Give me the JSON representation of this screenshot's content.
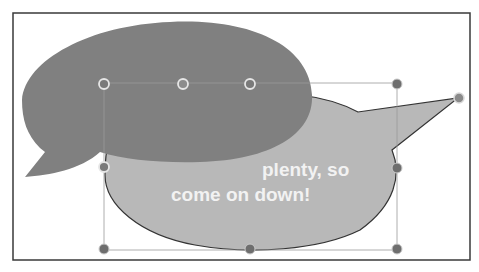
{
  "slide": {
    "background": "#ffffff",
    "border_color": "#333333"
  },
  "shapes": {
    "front_bubble": {
      "fill": "#808080",
      "kind": "oval-callout",
      "tail_direction": "lower-left"
    },
    "back_bubble": {
      "fill": "#b8b8b8",
      "outline": "#333333",
      "kind": "oval-callout",
      "tail_direction": "right",
      "text_line_1": "… plenty, so",
      "text_line_1_visible": "plenty, so",
      "text_line_2": "come on down!"
    }
  },
  "selection": {
    "handle_color": "#8a8a8a",
    "handle_outline": "#e0e0e0",
    "front_handles": [
      "top-left",
      "top-middle",
      "top-right",
      "middle-left"
    ],
    "back_handles": [
      "top-right",
      "middle-right",
      "bottom-left",
      "bottom-middle",
      "bottom-right",
      "tail-adjust"
    ]
  }
}
